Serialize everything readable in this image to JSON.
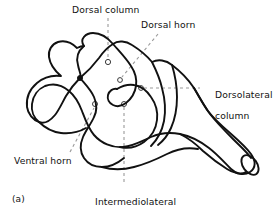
{
  "figure": {
    "caption": "(a)",
    "line_color": "#000000",
    "leader_color": "#9a9a9a",
    "background": "#ffffff"
  },
  "labels": [
    {
      "id": "dorsal-column",
      "text": "Dorsal column",
      "line1": "Dorsal column",
      "line2": ""
    },
    {
      "id": "dorsal-horn",
      "text": "Dorsal horn",
      "line1": "Dorsal horn",
      "line2": ""
    },
    {
      "id": "dorsolateral-column",
      "text": "Dorsolateral column",
      "line1": "Dorsolateral",
      "line2": "column"
    },
    {
      "id": "ventral-horn",
      "text": "Ventral horn",
      "line1": "Ventral horn",
      "line2": ""
    },
    {
      "id": "intermediolateral-column",
      "text": "Intermediolateral column",
      "line1": "Intermediolateral",
      "line2": "column"
    }
  ],
  "markers": [
    {
      "id": "marker-dorsal-column",
      "x": 108,
      "y": 62,
      "r": 2.6
    },
    {
      "id": "marker-dorsal-horn",
      "x": 120,
      "y": 80,
      "r": 2.4
    },
    {
      "id": "marker-dorsolateral-column",
      "x": 141,
      "y": 88,
      "r": 2.4
    },
    {
      "id": "marker-ventral-horn",
      "x": 95,
      "y": 104,
      "r": 2.5
    },
    {
      "id": "marker-intermediolateral-column",
      "x": 124,
      "y": 104,
      "r": 2.5
    },
    {
      "id": "marker-junction-dot",
      "x": 80,
      "y": 78,
      "r": 2.4,
      "filled": true
    }
  ]
}
